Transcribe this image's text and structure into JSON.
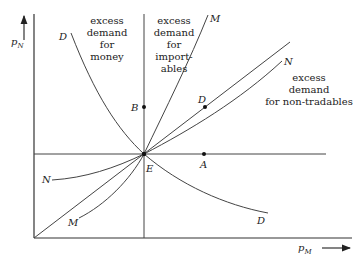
{
  "diagram": {
    "axes": {
      "y_label": "p",
      "y_sub": "N",
      "x_label": "p",
      "x_sub": "M"
    },
    "regions": {
      "money": [
        "excess",
        "demand",
        "for",
        "money"
      ],
      "importables": [
        "excess",
        "demand",
        "for",
        "import-",
        "ables"
      ],
      "non_tradables": [
        "excess",
        "demand",
        "for non-tradables"
      ]
    },
    "curves": {
      "D_top": "D",
      "D_bottom": "D",
      "M_top": "M",
      "M_bottom": "M",
      "N_right": "N",
      "N_left": "N"
    },
    "points": {
      "E": "E",
      "A": "A",
      "B": "B",
      "D": "D"
    }
  }
}
